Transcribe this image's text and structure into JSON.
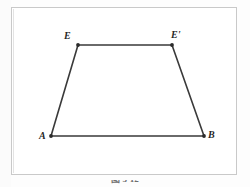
{
  "figure": {
    "caption": "图 3-12",
    "frame_color": "#c9c9c9",
    "line_color": "#3a3a3a",
    "background_color": "#ffffff",
    "vertices": [
      {
        "id": "A",
        "label": "A",
        "x": 51,
        "y": 136
      },
      {
        "id": "B",
        "label": "B",
        "x": 204,
        "y": 136
      },
      {
        "id": "E",
        "label": "E",
        "x": 78,
        "y": 45
      },
      {
        "id": "Ep",
        "label": "E'",
        "x": 172,
        "y": 45
      }
    ],
    "edges": [
      {
        "id": "edge-A-B",
        "from": "A",
        "to": "B"
      },
      {
        "id": "edge-A-E",
        "from": "A",
        "to": "E"
      },
      {
        "id": "edge-E-Ep",
        "from": "E",
        "to": "Ep"
      },
      {
        "id": "edge-Ep-B",
        "from": "Ep",
        "to": "B"
      }
    ]
  }
}
